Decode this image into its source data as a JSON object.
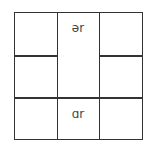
{
  "diagram": {
    "type": "3x3 grid with merged center column cells",
    "cells": [
      {
        "row": 1,
        "col": 2,
        "rowspan": 2,
        "label": "ər"
      },
      {
        "row": 3,
        "col": 2,
        "label": "ɑr"
      }
    ],
    "line_color": "#333333"
  }
}
